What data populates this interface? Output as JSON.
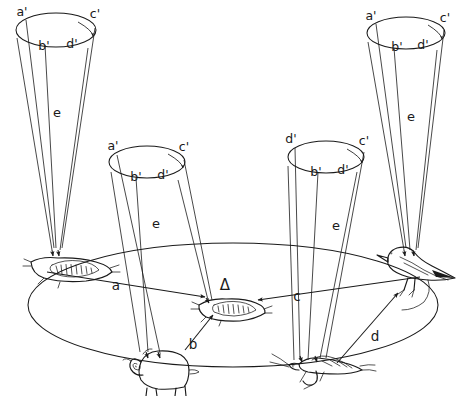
{
  "figure": {
    "background_color": "#ffffff",
    "ink_color": "#1a1a1a"
  },
  "ground": {
    "name": "ground-ellipse",
    "shape": "ellipse"
  },
  "cones": [
    {
      "id": "cone-1",
      "position": "top-left",
      "axis_label": "e",
      "rim_labels": {
        "left": "a'",
        "mid_left": "b'",
        "mid_right": "d'",
        "right": "c'"
      },
      "arc_arrow": "d'-to-c'",
      "targets": [
        "tick-left"
      ]
    },
    {
      "id": "cone-2",
      "position": "upper-center-left",
      "axis_label": "e",
      "rim_labels": {
        "left": "a'",
        "mid_left": "b'",
        "mid_right": "d'",
        "right": "c'"
      },
      "arc_arrow": "d'-to-c'",
      "targets": [
        "tick-center",
        "ram"
      ]
    },
    {
      "id": "cone-3",
      "position": "upper-center-right",
      "axis_label": "e",
      "rim_labels": {
        "left": "d'",
        "mid_left": "b'",
        "mid_right": "d'",
        "right": "c'"
      },
      "arc_arrow": "d'-to-c'",
      "targets": [
        "grasshopper"
      ]
    },
    {
      "id": "cone-4",
      "position": "top-right",
      "axis_label": "e",
      "rim_labels": {
        "left": "a'",
        "mid_left": "b'",
        "mid_right": "d'",
        "right": "c'"
      },
      "arc_arrow": "d'-to-c'",
      "targets": [
        "bird"
      ]
    }
  ],
  "organisms": [
    {
      "id": "tick-left",
      "name": "tick-left",
      "kind": "tick",
      "marker": ""
    },
    {
      "id": "tick-center",
      "name": "tick-center",
      "kind": "tick",
      "marker": "Δ"
    },
    {
      "id": "ram",
      "name": "ram",
      "kind": "ram",
      "marker": ""
    },
    {
      "id": "grasshopper",
      "name": "grasshopper",
      "kind": "grasshopper",
      "marker": ""
    },
    {
      "id": "bird",
      "name": "bird",
      "kind": "bird",
      "marker": ""
    }
  ],
  "transfer_arrows": [
    {
      "id": "arrow-a",
      "label": "a",
      "from": "tick-left",
      "to": "tick-center"
    },
    {
      "id": "arrow-b",
      "label": "b",
      "from": "ram",
      "to": "tick-center"
    },
    {
      "id": "arrow-c",
      "label": "c",
      "from": "bird",
      "to": "tick-center"
    },
    {
      "id": "arrow-d",
      "label": "d",
      "from": "grasshopper",
      "to": "bird"
    }
  ],
  "markers": {
    "delta": "Δ"
  }
}
